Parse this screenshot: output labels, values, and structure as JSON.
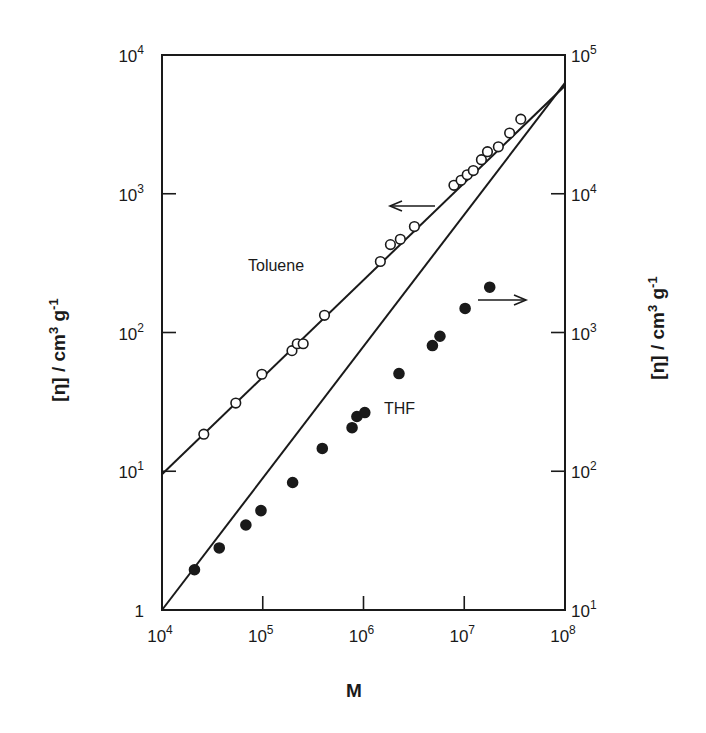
{
  "chart_data": {
    "type": "scatter",
    "title": "",
    "xlabel": "M",
    "ylabel_left": "[η] / cm3 g-1",
    "ylabel_right": "[η] / cm3 g-1",
    "xscale": "log",
    "yscale": "log",
    "xlim": [
      10000,
      100000000
    ],
    "ylim_left": [
      1,
      10000
    ],
    "ylim_right": [
      10,
      100000
    ],
    "x_ticks": [
      {
        "base": "10",
        "exp": "4"
      },
      {
        "base": "10",
        "exp": "5"
      },
      {
        "base": "10",
        "exp": "6"
      },
      {
        "base": "10",
        "exp": "7"
      },
      {
        "base": "10",
        "exp": "8"
      }
    ],
    "y_ticks_left": [
      {
        "base": "1",
        "exp": ""
      },
      {
        "base": "10",
        "exp": "1"
      },
      {
        "base": "10",
        "exp": "2"
      },
      {
        "base": "10",
        "exp": "3"
      },
      {
        "base": "10",
        "exp": "4"
      }
    ],
    "y_ticks_right": [
      {
        "base": "10",
        "exp": "1"
      },
      {
        "base": "10",
        "exp": "2"
      },
      {
        "base": "10",
        "exp": "3"
      },
      {
        "base": "10",
        "exp": "4"
      },
      {
        "base": "10",
        "exp": "5"
      }
    ],
    "grid": false,
    "legend": null,
    "annotations": [
      {
        "text": "Toluene",
        "note": "open circles, read on left axis (arrow pointing left)"
      },
      {
        "text": "THF",
        "note": "filled circles, read on right axis (arrow pointing right)"
      }
    ],
    "series": [
      {
        "name": "Toluene",
        "axis": "left",
        "marker": "open-circle",
        "fit_line": {
          "x": [
            10000,
            100000000
          ],
          "y": [
            9.5,
            6000
          ]
        },
        "points": [
          {
            "x": 26000,
            "y": 18.5
          },
          {
            "x": 54000,
            "y": 31
          },
          {
            "x": 98000,
            "y": 50
          },
          {
            "x": 195000,
            "y": 74
          },
          {
            "x": 220000,
            "y": 83
          },
          {
            "x": 252000,
            "y": 83
          },
          {
            "x": 410000,
            "y": 133
          },
          {
            "x": 1470000,
            "y": 325
          },
          {
            "x": 1850000,
            "y": 430
          },
          {
            "x": 2320000,
            "y": 470
          },
          {
            "x": 3200000,
            "y": 580
          },
          {
            "x": 7900000,
            "y": 1150
          },
          {
            "x": 9300000,
            "y": 1250
          },
          {
            "x": 10700000,
            "y": 1370
          },
          {
            "x": 12300000,
            "y": 1470
          },
          {
            "x": 14800000,
            "y": 1760
          },
          {
            "x": 17000000,
            "y": 2010
          },
          {
            "x": 21800000,
            "y": 2180
          },
          {
            "x": 28200000,
            "y": 2740
          },
          {
            "x": 36400000,
            "y": 3450
          }
        ]
      },
      {
        "name": "THF",
        "axis": "right",
        "marker": "filled-circle",
        "fit_line": {
          "x": [
            10000,
            100000000
          ],
          "y": [
            10,
            63000
          ]
        },
        "points": [
          {
            "x": 21000,
            "y": 19.5
          },
          {
            "x": 37000,
            "y": 28
          },
          {
            "x": 68000,
            "y": 41
          },
          {
            "x": 96000,
            "y": 52
          },
          {
            "x": 198000,
            "y": 83
          },
          {
            "x": 390000,
            "y": 146
          },
          {
            "x": 770000,
            "y": 206
          },
          {
            "x": 860000,
            "y": 248
          },
          {
            "x": 1030000,
            "y": 265
          },
          {
            "x": 2250000,
            "y": 506
          },
          {
            "x": 4830000,
            "y": 805
          },
          {
            "x": 5740000,
            "y": 940
          },
          {
            "x": 10200000,
            "y": 1490
          },
          {
            "x": 17900000,
            "y": 2120
          }
        ]
      }
    ]
  },
  "labels": {
    "toluene": "Toluene",
    "thf": "THF",
    "x_axis_title": "M",
    "y_axis_title_main": "[η] / cm",
    "y_axis_title_sup1": "3",
    "y_axis_title_mid": " g",
    "y_axis_title_sup2": "-1"
  },
  "layout": {
    "plot_left": 162,
    "plot_right": 565,
    "plot_top": 55,
    "plot_bottom": 610,
    "ink_color": "#1a1a1a"
  }
}
